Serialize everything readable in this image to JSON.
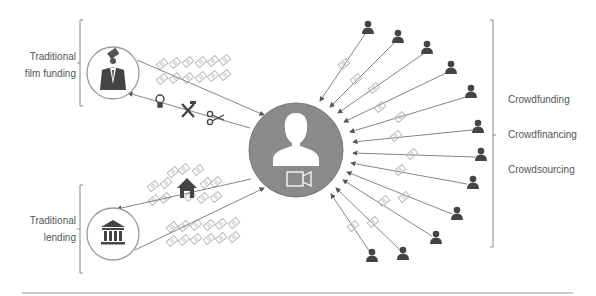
{
  "left_labels": {
    "film_funding": [
      "Traditional",
      "film funding"
    ],
    "lending": [
      "Traditional",
      "lending"
    ]
  },
  "right_labels": [
    "Crowdfunding",
    "Crowdfinancing",
    "Crowdsourcing"
  ],
  "center": {
    "icons": [
      "person-icon",
      "video-camera-icon"
    ]
  },
  "nodes": {
    "film_funding_icon": "businessman-icon",
    "lending_icon": "bank-icon",
    "lending_house_icon": "house-icon",
    "resource_icons": [
      "lightbulb-icon",
      "tools-icon",
      "scissors-icon"
    ],
    "crowd_count": 12
  },
  "colors": {
    "circle_fill": "#8a8a8a",
    "icon_dark": "#444444",
    "line": "#777777",
    "money": "#bbbbbb",
    "text": "#555555"
  }
}
